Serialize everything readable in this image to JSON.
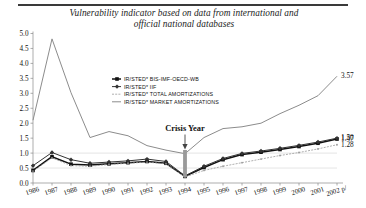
{
  "chart_data": {
    "type": "line",
    "title": "Vulnerability indicator based on data from international and official national databases",
    "title_line1": "Vulnerability indicator based on data from international and",
    "title_line2": "official national databases",
    "xlabel": "",
    "ylabel": "",
    "ylim": [
      0.0,
      5.0
    ],
    "ytick_step": 0.5,
    "grid": true,
    "legend_position": "upper-center",
    "categories": [
      "1986",
      "1987",
      "1988",
      "1989",
      "1990",
      "1991",
      "1992",
      "1993",
      "1994",
      "1995",
      "1996",
      "1997",
      "1998",
      "1999",
      "2000",
      "2001",
      "2002 p/"
    ],
    "yticks": [
      "0.0",
      "0.5",
      "1.0",
      "1.5",
      "2.0",
      "2.5",
      "3.0",
      "3.5",
      "4.0",
      "4.5",
      "5.0"
    ],
    "series": [
      {
        "name": "IR/STED*  BIS-IMF-OECD-WB",
        "label_short": "BIS-IMF-OECD-WB",
        "marker": "square-filled",
        "color": "#111111",
        "width": 1.5,
        "values": [
          0.42,
          0.88,
          0.63,
          0.6,
          0.64,
          0.68,
          0.72,
          0.66,
          0.22,
          0.52,
          0.78,
          0.95,
          1.03,
          1.12,
          1.22,
          1.33,
          1.47
        ]
      },
      {
        "name": "IR/STED*  IIF",
        "label_short": "IIF",
        "marker": "diamond-filled",
        "color": "#333333",
        "width": 1.0,
        "values": [
          0.58,
          1.02,
          0.78,
          0.66,
          0.7,
          0.74,
          0.8,
          0.72,
          0.24,
          0.56,
          0.82,
          0.99,
          1.07,
          1.16,
          1.26,
          1.37,
          1.5
        ]
      },
      {
        "name": "IR/STED*  TOTAL AMORTIZATIONS",
        "label_short": "TOTAL AMORTIZATIONS",
        "marker": "dot",
        "color": "#9a9a9a",
        "width": 0.8,
        "values": [
          0.4,
          0.84,
          0.58,
          0.56,
          0.62,
          0.66,
          0.7,
          0.64,
          0.2,
          0.42,
          0.56,
          0.68,
          0.8,
          0.92,
          1.02,
          1.14,
          1.28
        ]
      },
      {
        "name": "IR/STED*  MARKET AMORTIZATIONS",
        "label_short": "MARKET AMORTIZATIONS",
        "marker": "none",
        "color": "#8c8c8c",
        "width": 1.0,
        "values": [
          2.1,
          4.82,
          3.02,
          1.52,
          1.72,
          1.58,
          1.25,
          1.1,
          0.98,
          1.52,
          1.82,
          1.88,
          2.0,
          2.32,
          2.6,
          2.92,
          3.57
        ]
      }
    ],
    "data_labels": [
      {
        "text": "3.57",
        "series": "IR/STED*  MARKET AMORTIZATIONS",
        "category": "2002 p/",
        "value": 3.57
      },
      {
        "text": "1.47",
        "series": "IR/STED*  BIS-IMF-OECD-WB",
        "category": "2002 p/",
        "value": 1.47
      },
      {
        "text": "1.50",
        "series": "IR/STED*  IIF",
        "category": "2002 p/",
        "value": 1.5
      },
      {
        "text": "1.28",
        "series": "IR/STED*  TOTAL AMORTIZATIONS",
        "category": "2002 p/",
        "value": 1.28
      }
    ],
    "annotations": [
      {
        "text": "Crisis Year",
        "category": "1994",
        "type": "arrow-down"
      }
    ]
  }
}
